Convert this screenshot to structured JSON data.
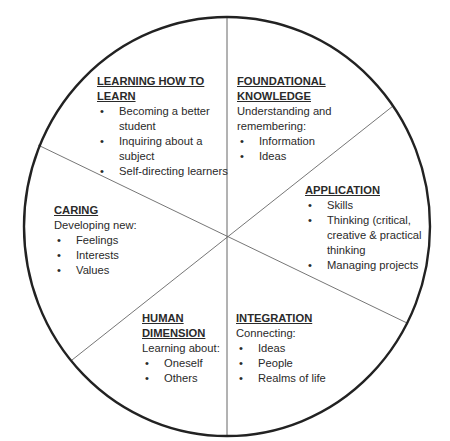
{
  "diagram": {
    "type": "wheel",
    "colors": {
      "outline": "#222222",
      "divider": "#555555",
      "text": "#2a2a2a",
      "background": "#ffffff"
    },
    "segments": [
      {
        "id": "learning-how-to-learn",
        "title": "LEARNING HOW TO LEARN",
        "title_lines": [
          "LEARNING HOW TO",
          "LEARN"
        ],
        "intro": "",
        "items": [
          "Becoming a better student",
          "Inquiring about a subject",
          "Self-directing learners"
        ]
      },
      {
        "id": "foundational-knowledge",
        "title": "FOUNDATIONAL KNOWLEDGE",
        "title_lines": [
          "FOUNDATIONAL",
          "KNOWLEDGE"
        ],
        "intro": "Understanding and remembering:",
        "items": [
          "Information",
          "Ideas"
        ]
      },
      {
        "id": "application",
        "title": "APPLICATION",
        "title_lines": [
          "APPLICATION"
        ],
        "intro": "",
        "items": [
          "Skills",
          "Thinking (critical, creative & practical thinking",
          "Managing projects"
        ]
      },
      {
        "id": "integration",
        "title": "INTEGRATION",
        "title_lines": [
          "INTEGRATION"
        ],
        "intro": "Connecting:",
        "items": [
          "Ideas",
          "People",
          "Realms of life"
        ]
      },
      {
        "id": "human-dimension",
        "title": "HUMAN DIMENSION",
        "title_lines": [
          "HUMAN",
          "DIMENSION"
        ],
        "intro": "Learning about:",
        "items": [
          "Oneself",
          "Others"
        ]
      },
      {
        "id": "caring",
        "title": "CARING",
        "title_lines": [
          "CARING"
        ],
        "intro": "Developing new:",
        "items": [
          "Feelings",
          "Interests",
          "Values"
        ]
      }
    ]
  }
}
